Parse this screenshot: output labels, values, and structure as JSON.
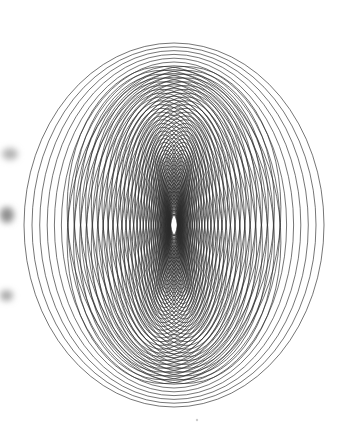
{
  "figure": {
    "type": "generative-line-art",
    "background_color": "#ffffff",
    "stroke_color": "#2b2b2b",
    "stroke_width": 0.65,
    "canvas": {
      "width": 362,
      "height": 436
    },
    "center": {
      "x": 174,
      "y": 225
    },
    "ellipse_count": 46,
    "outer_extents": {
      "left": 23,
      "right": 324,
      "top": 42,
      "bottom": 406
    },
    "rx_range": [
      3,
      150
    ],
    "ry_range": [
      8,
      182
    ],
    "rx_falloff": "fast",
    "ry_falloff": "slow",
    "core_lens_column": {
      "x": 174,
      "y_top": 168,
      "y_bottom": 292,
      "lens_count": 9,
      "note": "narrow overlapping lens shapes stacked vertically at the core"
    },
    "edge_smudges": [
      {
        "x": 2,
        "y": 148,
        "w": 16,
        "h": 12,
        "color": "#b4b4b4",
        "blur": 4
      },
      {
        "x": 0,
        "y": 207,
        "w": 14,
        "h": 16,
        "color": "#8e8e8e",
        "blur": 4
      },
      {
        "x": 0,
        "y": 290,
        "w": 13,
        "h": 11,
        "color": "#a8a8a8",
        "blur": 4
      }
    ],
    "speck": {
      "x": 197,
      "y": 420,
      "r": 1.2,
      "color": "#cccccc"
    }
  },
  "chart_data": {
    "type": "line",
    "xlabel": "",
    "ylabel": "",
    "grid": false,
    "legend": "none",
    "center": [
      174,
      225
    ],
    "series": [
      {
        "name": "ellipse-01",
        "rx": 150.0,
        "ry": 182.0
      },
      {
        "name": "ellipse-02",
        "rx": 142.0,
        "ry": 178.2
      },
      {
        "name": "ellipse-03",
        "rx": 134.3,
        "ry": 174.4
      },
      {
        "name": "ellipse-04",
        "rx": 126.8,
        "ry": 170.6
      },
      {
        "name": "ellipse-05",
        "rx": 119.6,
        "ry": 166.8
      },
      {
        "name": "ellipse-06",
        "rx": 112.6,
        "ry": 163.0
      },
      {
        "name": "ellipse-07",
        "rx": 105.9,
        "ry": 159.2
      },
      {
        "name": "ellipse-08",
        "rx": 99.4,
        "ry": 155.4
      },
      {
        "name": "ellipse-09",
        "rx": 93.2,
        "ry": 151.6
      },
      {
        "name": "ellipse-10",
        "rx": 87.2,
        "ry": 147.8
      },
      {
        "name": "ellipse-11",
        "rx": 81.4,
        "ry": 144.0
      },
      {
        "name": "ellipse-12",
        "rx": 75.9,
        "ry": 140.2
      },
      {
        "name": "ellipse-13",
        "rx": 70.6,
        "ry": 136.4
      },
      {
        "name": "ellipse-14",
        "rx": 65.6,
        "ry": 132.6
      },
      {
        "name": "ellipse-15",
        "rx": 60.8,
        "ry": 128.8
      },
      {
        "name": "ellipse-16",
        "rx": 56.2,
        "ry": 125.0
      },
      {
        "name": "ellipse-17",
        "rx": 51.9,
        "ry": 121.2
      },
      {
        "name": "ellipse-18",
        "rx": 47.8,
        "ry": 117.4
      },
      {
        "name": "ellipse-19",
        "rx": 43.9,
        "ry": 113.6
      },
      {
        "name": "ellipse-20",
        "rx": 40.2,
        "ry": 109.8
      },
      {
        "name": "ellipse-21",
        "rx": 36.8,
        "ry": 106.0
      },
      {
        "name": "ellipse-22",
        "rx": 33.6,
        "ry": 102.2
      },
      {
        "name": "ellipse-23",
        "rx": 30.6,
        "ry": 98.4
      },
      {
        "name": "ellipse-24",
        "rx": 27.8,
        "ry": 94.6
      },
      {
        "name": "ellipse-25",
        "rx": 25.2,
        "ry": 90.8
      },
      {
        "name": "ellipse-26",
        "rx": 22.8,
        "ry": 87.0
      },
      {
        "name": "ellipse-27",
        "rx": 20.6,
        "ry": 83.2
      },
      {
        "name": "ellipse-28",
        "rx": 18.6,
        "ry": 79.4
      },
      {
        "name": "ellipse-29",
        "rx": 16.8,
        "ry": 75.6
      },
      {
        "name": "ellipse-30",
        "rx": 15.2,
        "ry": 71.8
      },
      {
        "name": "ellipse-31",
        "rx": 13.7,
        "ry": 68.0
      },
      {
        "name": "ellipse-32",
        "rx": 12.4,
        "ry": 64.2
      },
      {
        "name": "ellipse-33",
        "rx": 11.2,
        "ry": 60.4
      },
      {
        "name": "ellipse-34",
        "rx": 10.2,
        "ry": 56.6
      },
      {
        "name": "ellipse-35",
        "rx": 9.3,
        "ry": 52.8
      },
      {
        "name": "ellipse-36",
        "rx": 8.5,
        "ry": 49.0
      },
      {
        "name": "ellipse-37",
        "rx": 7.8,
        "ry": 45.2
      },
      {
        "name": "ellipse-38",
        "rx": 7.1,
        "ry": 41.4
      },
      {
        "name": "ellipse-39",
        "rx": 6.5,
        "ry": 37.6
      },
      {
        "name": "ellipse-40",
        "rx": 6.0,
        "ry": 33.8
      },
      {
        "name": "ellipse-41",
        "rx": 5.5,
        "ry": 30.0
      },
      {
        "name": "ellipse-42",
        "rx": 5.0,
        "ry": 26.2
      },
      {
        "name": "ellipse-43",
        "rx": 4.6,
        "ry": 22.4
      },
      {
        "name": "ellipse-44",
        "rx": 4.2,
        "ry": 18.6
      },
      {
        "name": "ellipse-45",
        "rx": 3.8,
        "ry": 14.8
      },
      {
        "name": "ellipse-46",
        "rx": 3.4,
        "ry": 11.0
      }
    ]
  }
}
